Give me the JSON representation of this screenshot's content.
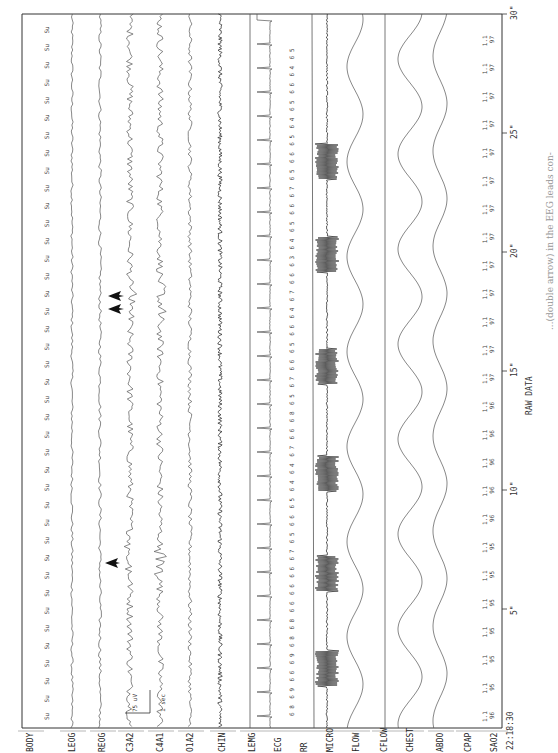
{
  "chart_data": {
    "type": "line",
    "title": "RAW DATA",
    "orientation": "rotated 90° counter-clockwise (time runs bottom to top)",
    "start_time": "22:18:30",
    "x_axis": {
      "label": "RAW DATA",
      "unit": "seconds",
      "range": [
        0,
        30
      ],
      "ticks": [
        "5\"",
        "10\"",
        "15\"",
        "20\"",
        "25\"",
        "30\""
      ]
    },
    "channels": [
      "BODY",
      "LEOG",
      "REOG",
      "C3A2",
      "C4A1",
      "O1A2",
      "CHIN",
      "LEMG",
      "ECG",
      "RR",
      "MICRO",
      "FLOW",
      "CFLOW",
      "CHEST",
      "ABDO",
      "CPAP",
      "SAO2"
    ],
    "body_position_labels": [
      "Su",
      "Su",
      "Su",
      "Su",
      "Su",
      "Su",
      "Su",
      "Su",
      "Su",
      "Su",
      "Su",
      "Su",
      "Su",
      "Su",
      "Su",
      "Su",
      "Su",
      "Su",
      "Su",
      "Su",
      "Su",
      "Su",
      "Su",
      "Su",
      "Su",
      "Su",
      "Su",
      "Su",
      "Su",
      "Su",
      "Su",
      "Su",
      "Su",
      "Su",
      "Su",
      "Su",
      "Su",
      "Su",
      "Su",
      "Su"
    ],
    "scale_marker": {
      "amplitude": "75 uV",
      "time": "1 sec"
    },
    "annotations": [
      {
        "type": "arrow",
        "channel": "C3A2",
        "time_s": 6.8,
        "description": "single arrow before EEG arousal"
      },
      {
        "type": "double-arrow",
        "channel": "C3A2",
        "time_s": 17.5,
        "description": "double arrow at EEG burst"
      }
    ],
    "micro_snore_bursts_s": [
      2.5,
      6.5,
      10.7,
      15.2,
      19.9,
      23.8
    ],
    "rr_values": [
      "8",
      "9",
      "6",
      "9",
      "8",
      "8",
      "6",
      "6",
      "6",
      "7",
      "5",
      "6",
      "5",
      "4",
      "4",
      "7",
      "6",
      "8",
      "5",
      "7",
      "6",
      "5",
      "6",
      "4",
      "7",
      "6",
      "3",
      "4",
      "5",
      "6",
      "7",
      "5",
      "6",
      "5",
      "4",
      "5",
      "6",
      "4",
      "5"
    ],
    "sao2_values": [
      {
        "cpap": "1.1",
        "sao2": "96"
      },
      {
        "cpap": "1.1",
        "sao2": "95"
      },
      {
        "cpap": "1.1",
        "sao2": "95"
      },
      {
        "cpap": "1.1",
        "sao2": "95"
      },
      {
        "cpap": "1.1",
        "sao2": "95"
      },
      {
        "cpap": "1.1",
        "sao2": "95"
      },
      {
        "cpap": "1.1",
        "sao2": "95"
      },
      {
        "cpap": "1.1",
        "sao2": "96"
      },
      {
        "cpap": "1.1",
        "sao2": "96"
      },
      {
        "cpap": "1.1",
        "sao2": "96"
      },
      {
        "cpap": "1.1",
        "sao2": "96"
      },
      {
        "cpap": "1.1",
        "sao2": "96"
      },
      {
        "cpap": "1.1",
        "sao2": "97"
      },
      {
        "cpap": "1.1",
        "sao2": "97"
      },
      {
        "cpap": "1.1",
        "sao2": "97"
      },
      {
        "cpap": "1.1",
        "sao2": "97"
      },
      {
        "cpap": "1.1",
        "sao2": "97"
      },
      {
        "cpap": "1.1",
        "sao2": "97"
      },
      {
        "cpap": "1.1",
        "sao2": "97"
      },
      {
        "cpap": "1.1",
        "sao2": "97"
      },
      {
        "cpap": "1.1",
        "sao2": "97"
      },
      {
        "cpap": "1.1",
        "sao2": "97"
      },
      {
        "cpap": "1.1",
        "sao2": "97"
      },
      {
        "cpap": "1.1",
        "sao2": "97"
      },
      {
        "cpap": "1.1",
        "sao2": "97"
      }
    ],
    "grid": false,
    "legend": "channel labels along left edge of rotated page"
  },
  "page": {
    "channel_labels": [
      "BODY",
      "LEOG",
      "REOG",
      "C3A2",
      "C4A1",
      "O1A2",
      "CHIN",
      "LEMG",
      "ECG",
      "RR",
      "MICRO",
      "FLOW",
      "CFLOW",
      "CHEST",
      "ABDO",
      "CPAP",
      "SAO2"
    ],
    "start_time": "22:18:30",
    "axis_title": "RAW DATA",
    "ticks": [
      "5\"",
      "10\"",
      "15\"",
      "20\"",
      "25\"",
      "30\""
    ],
    "scale_uv": "75 uV",
    "scale_sec": "1 sec",
    "caption_fragment": "...(double arrow) in the EEG leads con-",
    "body_label": "Su"
  }
}
